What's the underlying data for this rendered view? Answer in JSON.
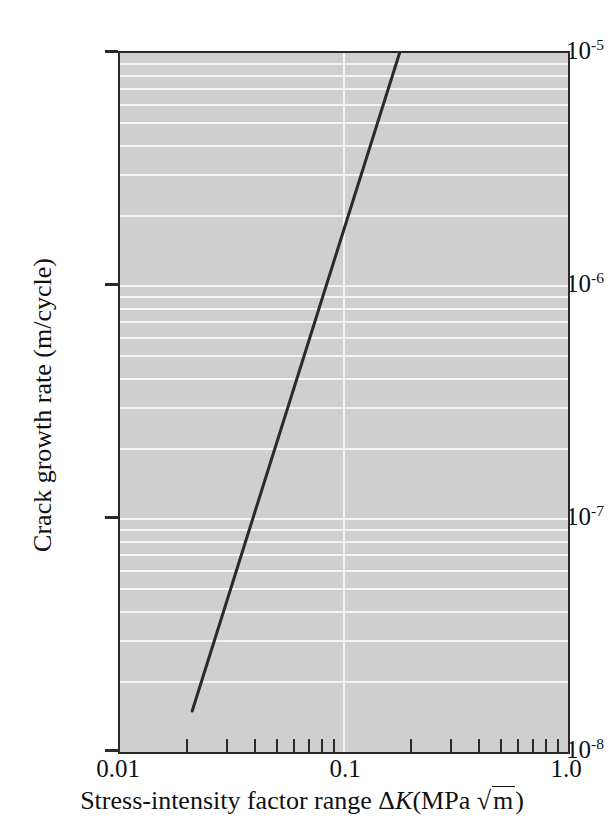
{
  "chart_data": {
    "type": "line",
    "title": "",
    "subtitle": "",
    "xlabel": "Stress-intensity factor range ΔK(MPa √m)",
    "ylabel": "Crack growth rate (m/cycle)",
    "xscale": "log",
    "yscale": "log",
    "xlim": [
      0.01,
      1.0
    ],
    "ylim": [
      1e-08,
      1e-05
    ],
    "grid": true,
    "grid_color": "#f4f4f4",
    "plot_background": "#cfcfcf",
    "legend": null,
    "x_tick_labels": [
      "0.01",
      "0.1",
      "1.0"
    ],
    "x_tick_values": [
      0.01,
      0.1,
      1.0
    ],
    "x_minor_tick_values": [
      0.02,
      0.03,
      0.04,
      0.05,
      0.06,
      0.07,
      0.08,
      0.09,
      0.2,
      0.3,
      0.4,
      0.5,
      0.6,
      0.7,
      0.8,
      0.9
    ],
    "y_tick_labels": [
      "10⁻⁵",
      "10⁻⁶",
      "10⁻⁷",
      "10⁻⁸"
    ],
    "y_tick_mantissa": "10",
    "y_tick_exponents": [
      "-5",
      "-6",
      "-7",
      "-8"
    ],
    "y_tick_values": [
      1e-05,
      1e-06,
      1e-07,
      1e-08
    ],
    "series": [
      {
        "name": "crack growth rate",
        "color": "#2a2a2a",
        "linewidth": 3,
        "x": [
          0.021,
          0.177
        ],
        "y": [
          1.5e-08,
          1e-05
        ]
      }
    ],
    "annotations": []
  },
  "axis_titles": {
    "x_prefix": "Stress-intensity factor range ",
    "x_symbol_delta": "Δ",
    "x_symbol_k": "K",
    "x_unit_open": "(MPa ",
    "x_radical": "√",
    "x_unit_m": "m",
    "x_unit_close": ")",
    "y_title": "Crack growth rate (m/cycle)"
  }
}
